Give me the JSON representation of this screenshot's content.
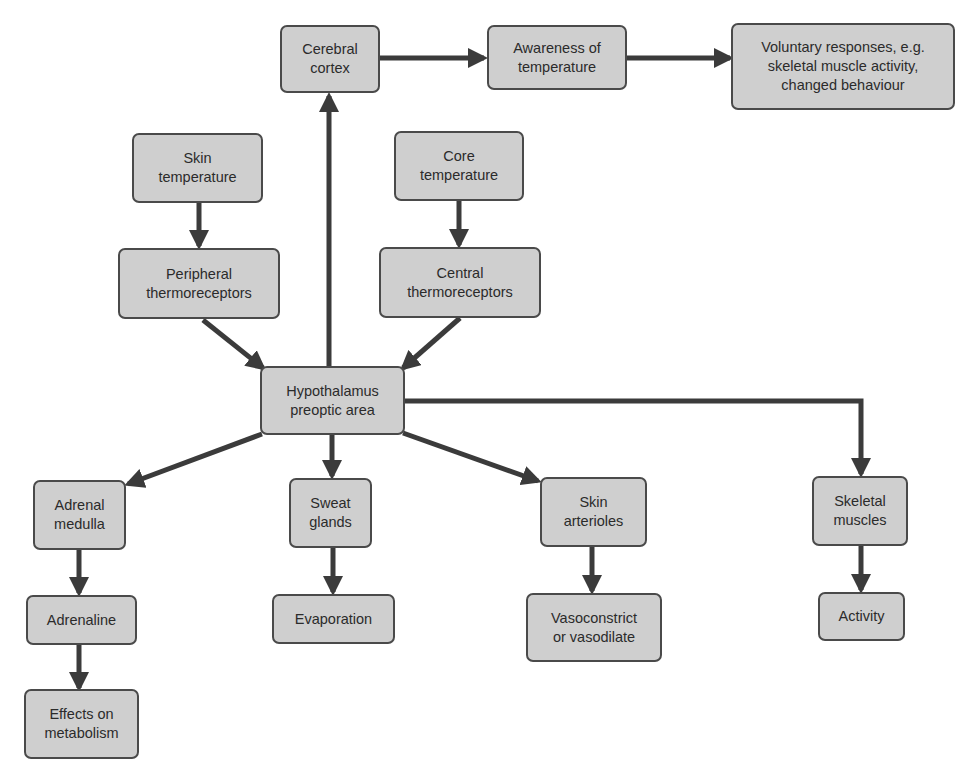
{
  "diagram": {
    "colors": {
      "node_fill": "#cfcfcf",
      "node_border": "#4a4a4a",
      "arrow": "#3b3b3b",
      "text": "#2b2b2b"
    },
    "nodes": {
      "cerebral_cortex": {
        "label": "Cerebral\ncortex"
      },
      "awareness": {
        "label": "Awareness of\ntemperature"
      },
      "voluntary": {
        "label": "Voluntary responses, e.g.\nskeletal muscle activity,\nchanged behaviour"
      },
      "skin_temp": {
        "label": "Skin\ntemperature"
      },
      "core_temp": {
        "label": "Core\ntemperature"
      },
      "peripheral": {
        "label": "Peripheral\nthermoreceptors"
      },
      "central": {
        "label": "Central\nthermoreceptors"
      },
      "hypothalamus": {
        "label": "Hypothalamus\npreoptic area"
      },
      "adrenal_medulla": {
        "label": "Adrenal\nmedulla"
      },
      "adrenaline": {
        "label": "Adrenaline"
      },
      "metabolism": {
        "label": "Effects on\nmetabolism"
      },
      "sweat_glands": {
        "label": "Sweat\nglands"
      },
      "evaporation": {
        "label": "Evaporation"
      },
      "skin_arterioles": {
        "label": "Skin\narterioles"
      },
      "vaso": {
        "label": "Vasoconstrict\nor vasodilate"
      },
      "skeletal_muscles": {
        "label": "Skeletal\nmuscles"
      },
      "activity": {
        "label": "Activity"
      }
    },
    "edges": [
      {
        "from": "cerebral_cortex",
        "to": "awareness"
      },
      {
        "from": "awareness",
        "to": "voluntary"
      },
      {
        "from": "skin_temp",
        "to": "peripheral"
      },
      {
        "from": "core_temp",
        "to": "central"
      },
      {
        "from": "peripheral",
        "to": "hypothalamus"
      },
      {
        "from": "central",
        "to": "hypothalamus"
      },
      {
        "from": "hypothalamus",
        "to": "cerebral_cortex"
      },
      {
        "from": "hypothalamus",
        "to": "adrenal_medulla"
      },
      {
        "from": "hypothalamus",
        "to": "sweat_glands"
      },
      {
        "from": "hypothalamus",
        "to": "skin_arterioles"
      },
      {
        "from": "hypothalamus",
        "to": "skeletal_muscles"
      },
      {
        "from": "adrenal_medulla",
        "to": "adrenaline"
      },
      {
        "from": "adrenaline",
        "to": "metabolism"
      },
      {
        "from": "sweat_glands",
        "to": "evaporation"
      },
      {
        "from": "skin_arterioles",
        "to": "vaso"
      },
      {
        "from": "skeletal_muscles",
        "to": "activity"
      }
    ]
  }
}
